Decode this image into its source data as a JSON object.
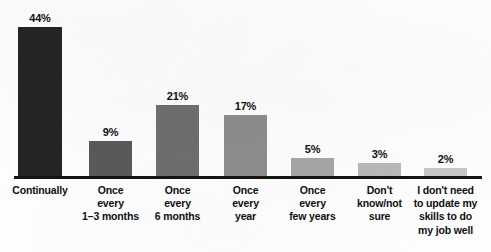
{
  "chart_data": {
    "type": "bar",
    "title": "",
    "subtitle": "",
    "xlabel": "",
    "ylabel": "",
    "ylim": [
      0,
      50
    ],
    "grid": false,
    "legend": false,
    "orientation": "vertical",
    "value_suffix": "%",
    "categories": [
      "Continually",
      "Once every 1–3 months",
      "Once every 6 months",
      "Once every year",
      "Once every few years",
      "Don't know/not sure",
      "I don't need to update my skills to do my job well"
    ],
    "values": [
      44,
      9,
      21,
      17,
      5,
      3,
      2
    ],
    "value_labels": [
      "44%",
      "9%",
      "21%",
      "17%",
      "5%",
      "3%",
      "2%"
    ],
    "bar_colors": [
      "#252525",
      "#595959",
      "#6e6e6e",
      "#8d8d8d",
      "#a6a6a6",
      "#b8b8b8",
      "#c6c6c6"
    ],
    "axis_color": "#141414",
    "background_color": "#fdfdfd",
    "label_color": "#0f0f0f",
    "bars": [
      {
        "category_lines": [
          "Continually"
        ],
        "value_label": "44%",
        "value": 44,
        "color": "#252525",
        "left": 18,
        "width": 44,
        "height": 150
      },
      {
        "category_lines": [
          "Once",
          "every",
          "1–3 months"
        ],
        "value_label": "9%",
        "value": 9,
        "color": "#595959",
        "left": 89,
        "width": 43,
        "height": 36
      },
      {
        "category_lines": [
          "Once",
          "every",
          "6 months"
        ],
        "value_label": "21%",
        "value": 21,
        "color": "#6e6e6e",
        "left": 156,
        "width": 43,
        "height": 72
      },
      {
        "category_lines": [
          "Once",
          "every",
          "year"
        ],
        "value_label": "17%",
        "value": 17,
        "color": "#8d8d8d",
        "left": 224,
        "width": 43,
        "height": 62
      },
      {
        "category_lines": [
          "Once",
          "every",
          "few years"
        ],
        "value_label": "5%",
        "value": 5,
        "color": "#a6a6a6",
        "left": 291,
        "width": 43,
        "height": 19
      },
      {
        "category_lines": [
          "Don't",
          "know/not",
          "sure"
        ],
        "value_label": "3%",
        "value": 3,
        "color": "#b8b8b8",
        "left": 358,
        "width": 43,
        "height": 14
      },
      {
        "category_lines": [
          "I don't need",
          "to update my",
          "skills to do",
          "my job well"
        ],
        "value_label": "2%",
        "value": 2,
        "color": "#c6c6c6",
        "left": 424,
        "width": 43,
        "height": 9
      }
    ]
  }
}
